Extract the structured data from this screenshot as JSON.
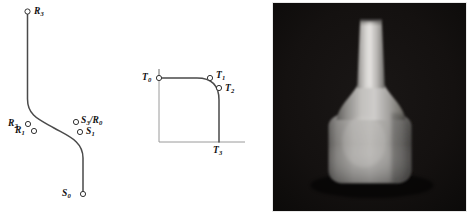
{
  "figure": {
    "background_color": "#ffffff",
    "panels": [
      {
        "id": "spline",
        "name": "control-polygon-spline-diagram"
      },
      {
        "id": "profile",
        "name": "rounded-corner-profile-diagram"
      },
      {
        "id": "render",
        "name": "rendered-vase-photograph"
      }
    ]
  },
  "spline_panel": {
    "name": "s-curve-control-point-diagram",
    "curve_color": "#4a4a4a",
    "marker_fill": "#ffffff",
    "marker_stroke": "#333333",
    "labels": [
      {
        "key": "R3",
        "base": "R",
        "sub": "3",
        "text": "R3"
      },
      {
        "key": "R2",
        "base": "R",
        "sub": "2",
        "text": "R2"
      },
      {
        "key": "R1",
        "base": "R",
        "sub": "1",
        "text": "R1"
      },
      {
        "key": "S3R0",
        "base": "S",
        "sub": "3",
        "text": "S3/R0"
      },
      {
        "key": "S1",
        "base": "S",
        "sub": "1",
        "text": "S1"
      },
      {
        "key": "S0",
        "base": "S",
        "sub": "0",
        "text": "S0"
      }
    ]
  },
  "profile_panel": {
    "name": "tangent-corner-profile-diagram",
    "axis_color": "#9a9a9a",
    "curve_color": "#4a4a4a",
    "labels": [
      {
        "key": "T0",
        "base": "T",
        "sub": "0",
        "text": "T0"
      },
      {
        "key": "T1",
        "base": "T",
        "sub": "1",
        "text": "T1"
      },
      {
        "key": "T2",
        "base": "T",
        "sub": "2",
        "text": "T2"
      },
      {
        "key": "T3",
        "base": "T",
        "sub": "3",
        "text": "T3"
      }
    ]
  },
  "render_panel": {
    "name": "vase-render-photo",
    "background_color": "#100e0e",
    "object_color": "#b9b9b9",
    "caption": ""
  }
}
